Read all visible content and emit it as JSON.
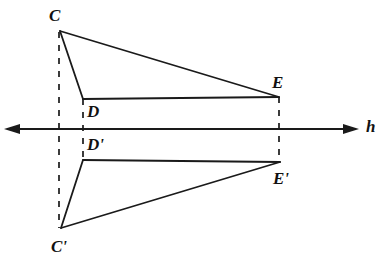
{
  "figure": {
    "width": 389,
    "height": 269,
    "background_color": "#ffffff",
    "stroke_color": "#1a1a1a",
    "axis_label": "h",
    "axis": {
      "name": "h",
      "y": 129,
      "x_start": 5,
      "x_end": 358,
      "arrow_left": true,
      "arrow_right": true
    },
    "points": {
      "C": {
        "label": "C",
        "x": 60,
        "y": 31
      },
      "D": {
        "label": "D",
        "x": 83,
        "y": 99
      },
      "E": {
        "label": "E",
        "x": 279,
        "y": 97
      },
      "Cp": {
        "label": "C'",
        "x": 61,
        "y": 228
      },
      "Dp": {
        "label": "D'",
        "x": 83,
        "y": 160
      },
      "Ep": {
        "label": "E'",
        "x": 280,
        "y": 162
      }
    },
    "labels": [
      {
        "name": "label-C",
        "text": "C",
        "x": 49,
        "y": 7
      },
      {
        "name": "label-D",
        "text": "D",
        "x": 87,
        "y": 103
      },
      {
        "name": "label-E",
        "text": "E",
        "x": 272,
        "y": 74
      },
      {
        "name": "label-D-prime",
        "text": "D'",
        "x": 87,
        "y": 136
      },
      {
        "name": "label-E-prime",
        "text": "E'",
        "x": 273,
        "y": 170
      },
      {
        "name": "label-C-prime",
        "text": "C'",
        "x": 51,
        "y": 238
      },
      {
        "name": "label-h",
        "text": "h",
        "x": 366,
        "y": 118
      }
    ],
    "solid_segments": [
      {
        "name": "segment-CE",
        "from": "C",
        "to": "E"
      },
      {
        "name": "segment-CD",
        "from": "C",
        "to": "D"
      },
      {
        "name": "segment-DE",
        "from": "D",
        "to": "E"
      },
      {
        "name": "segment-CpEp",
        "from": "Cp",
        "to": "Ep"
      },
      {
        "name": "segment-CpDp",
        "from": "Cp",
        "to": "Dp"
      },
      {
        "name": "segment-DpEp",
        "from": "Dp",
        "to": "Ep"
      }
    ],
    "dashed_segments": [
      {
        "name": "dashed-connector-C-Cprime",
        "x": 59,
        "y1": 32,
        "y2": 228
      },
      {
        "name": "dashed-connector-D-Dprime",
        "x": 83,
        "y1": 99,
        "y2": 160
      },
      {
        "name": "dashed-connector-E-Eprime",
        "x": 279,
        "y1": 97,
        "y2": 163
      }
    ]
  }
}
